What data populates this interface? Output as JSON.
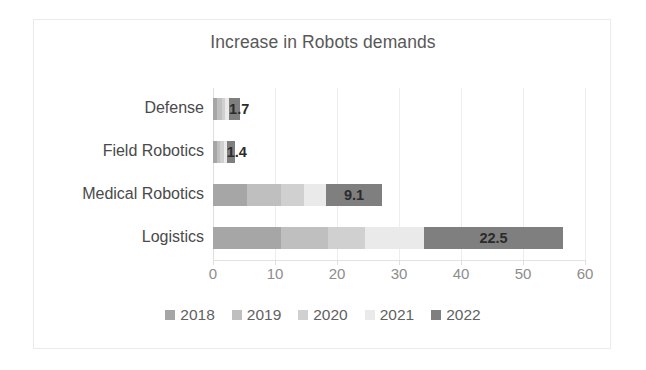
{
  "chart_data": {
    "type": "bar",
    "orientation": "horizontal",
    "stacked": true,
    "title": "Increase in Robots demands",
    "xlabel": "",
    "ylabel": "",
    "xlim": [
      0,
      60
    ],
    "xticks": [
      0,
      10,
      20,
      30,
      40,
      50,
      60
    ],
    "xtick_labels": [
      "0",
      "10",
      "20",
      "30",
      "40",
      "50",
      "60"
    ],
    "grid": true,
    "grid_axis": "x",
    "legend_position": "bottom",
    "categories": [
      "Defense",
      "Field Robotics",
      "Medical Robotics",
      "Logistics"
    ],
    "series": [
      {
        "name": "2018",
        "color": "#a6a6a6",
        "values": [
          0.7,
          0.6,
          5.5,
          11.0
        ]
      },
      {
        "name": "2019",
        "color": "#bfbfbf",
        "values": [
          0.7,
          0.6,
          5.5,
          7.5
        ]
      },
      {
        "name": "2020",
        "color": "#d0d0d0",
        "values": [
          0.6,
          0.5,
          3.6,
          6.0
        ]
      },
      {
        "name": "2021",
        "color": "#eaeaea",
        "values": [
          0.6,
          0.5,
          3.6,
          9.5
        ]
      },
      {
        "name": "2022",
        "color": "#7f7f7f",
        "values": [
          1.7,
          1.4,
          9.1,
          22.5
        ]
      }
    ],
    "data_labels": [
      {
        "category": "Defense",
        "series": "2022",
        "text": "1.7"
      },
      {
        "category": "Field Robotics",
        "series": "2022",
        "text": "1.4"
      },
      {
        "category": "Medical Robotics",
        "series": "2022",
        "text": "9.1"
      },
      {
        "category": "Logistics",
        "series": "2022",
        "text": "22.5"
      }
    ],
    "totals": [
      4.3,
      3.6,
      27.3,
      56.5
    ]
  },
  "legend": {
    "items": [
      {
        "label": "2018",
        "color": "#a6a6a6"
      },
      {
        "label": "2019",
        "color": "#bfbfbf"
      },
      {
        "label": "2020",
        "color": "#d0d0d0"
      },
      {
        "label": "2021",
        "color": "#eaeaea"
      },
      {
        "label": "2022",
        "color": "#7f7f7f"
      }
    ]
  },
  "colors": {
    "title": "#585858",
    "category_label": "#4a4a4a",
    "tick_label": "#8d8d8d",
    "gridline": "#ededed",
    "frame": "#eceaea",
    "background": "#ffffff",
    "data_label": "#2b2b2b"
  }
}
